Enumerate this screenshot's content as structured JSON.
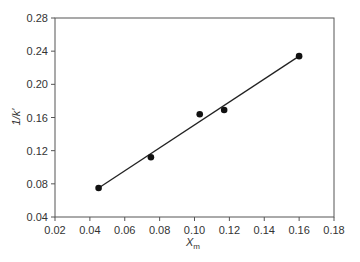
{
  "chart_data": {
    "type": "scatter",
    "title": "",
    "xlabel": "X",
    "xlabel_sub": "m",
    "ylabel": "1/k'",
    "xlim": [
      0.02,
      0.18
    ],
    "ylim": [
      0.04,
      0.28
    ],
    "xticks": [
      "0.02",
      "0.04",
      "0.06",
      "0.08",
      "0.10",
      "0.12",
      "0.14",
      "0.16",
      "0.18"
    ],
    "yticks": [
      "0.04",
      "0.08",
      "0.12",
      "0.16",
      "0.20",
      "0.24",
      "0.28"
    ],
    "grid": false,
    "legend": null,
    "series": [
      {
        "name": "data",
        "marker": "filled-circle",
        "x": [
          0.045,
          0.075,
          0.103,
          0.117,
          0.16
        ],
        "y": [
          0.075,
          0.112,
          0.164,
          0.169,
          0.234
        ]
      },
      {
        "name": "linear fit",
        "style": "line",
        "x": [
          0.045,
          0.16
        ],
        "y": [
          0.075,
          0.234
        ]
      }
    ]
  },
  "colors": {
    "axis": "#555555",
    "marker": "#111111",
    "line": "#222222"
  }
}
